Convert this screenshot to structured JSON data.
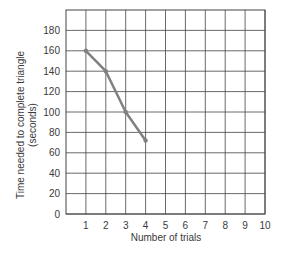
{
  "chart_data": {
    "type": "line",
    "title": "",
    "xlabel": "Number of trials",
    "ylabel": "Time needed to complete triangle",
    "ylabel_sub": "(seconds)",
    "x": [
      1,
      2,
      3,
      4
    ],
    "series": [
      {
        "name": "Time needed",
        "values": [
          160,
          140,
          100,
          72
        ]
      }
    ],
    "xlim": [
      0,
      10
    ],
    "ylim": [
      0,
      200
    ],
    "xticks": [
      1,
      2,
      3,
      4,
      5,
      6,
      7,
      8,
      9,
      10
    ],
    "yticks": [
      0,
      20,
      40,
      60,
      80,
      100,
      120,
      140,
      160,
      180
    ],
    "grid": true,
    "legend": "none",
    "colors": {
      "line": "#808080",
      "grid": "#444444",
      "text": "#3a3a3a"
    }
  }
}
